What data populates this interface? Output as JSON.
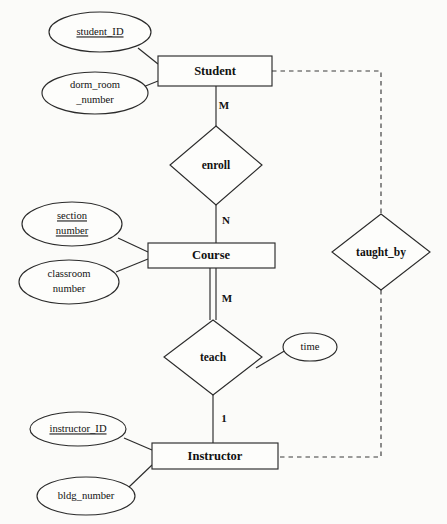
{
  "diagram": {
    "notation": "Chen",
    "background_color": "#fbfbf9",
    "line_color": "#2b2b2b",
    "text_color": "#111111"
  },
  "entities": [
    {
      "id": "student",
      "label": "Student",
      "x": 215,
      "y": 71,
      "w": 114,
      "h": 30
    },
    {
      "id": "course",
      "label": "Course",
      "x": 211,
      "y": 255,
      "w": 127,
      "h": 25
    },
    {
      "id": "instructor",
      "label": "Instructor",
      "x": 215,
      "y": 455,
      "w": 126,
      "h": 26
    }
  ],
  "relationships": [
    {
      "id": "enroll",
      "label": "enroll",
      "x": 216,
      "y": 165,
      "rx": 46,
      "ry": 40
    },
    {
      "id": "teach",
      "label": "teach",
      "x": 213,
      "y": 357,
      "rx": 49,
      "ry": 38
    },
    {
      "id": "taught_by",
      "label": "taught_by",
      "x": 381,
      "y": 252,
      "rx": 49,
      "ry": 38
    }
  ],
  "attributes": [
    {
      "id": "student_id",
      "lines": [
        "student_ID"
      ],
      "is_key": true,
      "owner": "student",
      "x": 100,
      "y": 32,
      "rx": 51,
      "ry": 20
    },
    {
      "id": "dorm_room_number",
      "lines": [
        "dorm_room",
        "_number"
      ],
      "is_key": false,
      "owner": "student",
      "x": 95,
      "y": 93,
      "rx": 53,
      "ry": 21
    },
    {
      "id": "section_number",
      "lines": [
        "section",
        "number"
      ],
      "is_key": true,
      "owner": "course",
      "x": 72,
      "y": 224,
      "rx": 50,
      "ry": 22
    },
    {
      "id": "classroom_number",
      "lines": [
        "classroom",
        "number"
      ],
      "is_key": false,
      "owner": "course",
      "x": 69,
      "y": 282,
      "rx": 50,
      "ry": 22
    },
    {
      "id": "time",
      "lines": [
        "time"
      ],
      "is_key": false,
      "owner": "teach",
      "x": 310,
      "y": 347,
      "rx": 27,
      "ry": 14
    },
    {
      "id": "instructor_id",
      "lines": [
        "instructor_ID"
      ],
      "is_key": true,
      "owner": "instructor",
      "x": 78,
      "y": 429,
      "rx": 48,
      "ry": 17
    },
    {
      "id": "bldg_number",
      "lines": [
        "bldg_number"
      ],
      "is_key": false,
      "owner": "instructor",
      "x": 86,
      "y": 496,
      "rx": 49,
      "ry": 19
    }
  ],
  "cardinalities": [
    {
      "id": "student-enroll",
      "label": "M",
      "x": 224,
      "y": 106
    },
    {
      "id": "enroll-course",
      "label": "N",
      "x": 226,
      "y": 221
    },
    {
      "id": "course-teach",
      "label": "M",
      "x": 227,
      "y": 299
    },
    {
      "id": "teach-instructor",
      "label": "1",
      "x": 224,
      "y": 419
    }
  ],
  "connections": [
    {
      "id": "student-to-enroll",
      "style": "solid"
    },
    {
      "id": "enroll-to-course",
      "style": "solid"
    },
    {
      "id": "course-to-teach",
      "style": "double"
    },
    {
      "id": "teach-to-instructor",
      "style": "solid"
    },
    {
      "id": "student-to-taught_by",
      "style": "dashed"
    },
    {
      "id": "taught_by-to-instructor",
      "style": "dashed"
    }
  ]
}
